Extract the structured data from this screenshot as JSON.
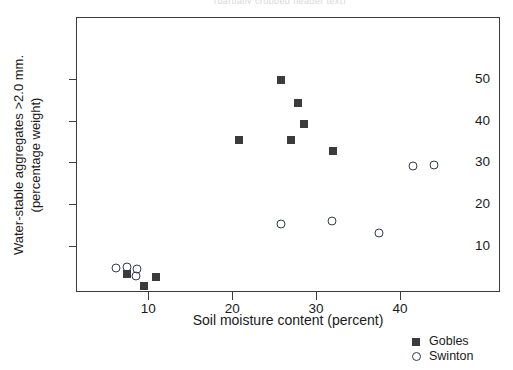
{
  "figure": {
    "top_cropped_text": "(partially cropped header text)"
  },
  "axes": {
    "x_title": "Soil moisture content (percent)",
    "y_title_line1": "Water-stable aggregates >2.0 mm.",
    "y_title_line2": "(percentage weight)",
    "x_ticks": [
      "10",
      "20",
      "30",
      "40"
    ],
    "y_ticks": [
      "10",
      "20",
      "30",
      "40",
      "50"
    ]
  },
  "legend": {
    "entries": [
      {
        "label": "Gobles",
        "marker": "filled-square-icon",
        "color": "#3b3b3b"
      },
      {
        "label": "Swinton",
        "marker": "open-circle-icon",
        "color": "#343a46"
      }
    ]
  },
  "chart_data": {
    "type": "scatter",
    "title": "",
    "xlabel": "Soil moisture content (percent)",
    "ylabel": "Water-stable aggregates >2.0 mm. (percentage weight)",
    "xlim": [
      1.4,
      51.9
    ],
    "ylim": [
      -1.0,
      64.8
    ],
    "xticks": [
      10,
      20,
      30,
      40
    ],
    "yticks": [
      10,
      20,
      30,
      40,
      50
    ],
    "grid": false,
    "legend_position": "outside bottom-right",
    "series": [
      {
        "name": "Gobles",
        "marker": "filled square",
        "color": "#3b3b3b",
        "points": [
          {
            "x": 7.5,
            "y": 3.3
          },
          {
            "x": 9.5,
            "y": 0.4
          },
          {
            "x": 10.9,
            "y": 2.6
          },
          {
            "x": 20.8,
            "y": 35.4
          },
          {
            "x": 25.8,
            "y": 49.8
          },
          {
            "x": 27.0,
            "y": 35.4
          },
          {
            "x": 27.8,
            "y": 44.2
          },
          {
            "x": 28.5,
            "y": 39.2
          },
          {
            "x": 32.0,
            "y": 32.7
          }
        ]
      },
      {
        "name": "Swinton",
        "marker": "open circle",
        "color": "#343a46",
        "points": [
          {
            "x": 6.2,
            "y": 4.8
          },
          {
            "x": 7.5,
            "y": 5.0
          },
          {
            "x": 8.7,
            "y": 4.6
          },
          {
            "x": 8.5,
            "y": 2.9
          },
          {
            "x": 25.8,
            "y": 15.2
          },
          {
            "x": 31.9,
            "y": 15.9
          },
          {
            "x": 37.5,
            "y": 13.0
          },
          {
            "x": 41.5,
            "y": 29.2
          },
          {
            "x": 44.0,
            "y": 29.3
          }
        ]
      }
    ]
  }
}
